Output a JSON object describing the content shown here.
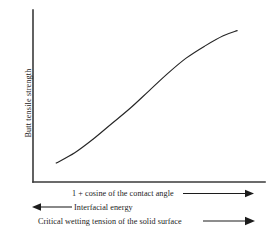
{
  "figure": {
    "background_color": "#ffffff",
    "axis_color": "#3a3a3a",
    "curve_color": "#262626",
    "annotation_color": "#1c1c1c"
  },
  "chart_data": {
    "type": "line",
    "title": "",
    "subtitle": "",
    "xlabel": "1 + cosine of the contact angle",
    "ylabel": "Butt tensile strength",
    "grid": false,
    "legend": false,
    "legend_position": "none",
    "axes_style": "open-left-bottom-spines-only",
    "tick_labels_x": [],
    "tick_labels_y": [],
    "xlim": [
      0,
      1
    ],
    "ylim": [
      0,
      1
    ],
    "series": [
      {
        "name": "butt tensile strength vs 1 + cosine of contact angle",
        "description": "monotonically increasing curve, concave up at the start, nearly linear in the middle, flattening (concave down) near the right end",
        "x": [
          0.1,
          0.18,
          0.26,
          0.34,
          0.42,
          0.5,
          0.58,
          0.66,
          0.74,
          0.82,
          0.88
        ],
        "y": [
          0.11,
          0.17,
          0.25,
          0.34,
          0.43,
          0.53,
          0.63,
          0.72,
          0.79,
          0.85,
          0.88
        ]
      }
    ],
    "annotations": [
      {
        "id": "contact-angle",
        "text": "1 + cosine of the contact angle",
        "direction": "right",
        "arrow": "right"
      },
      {
        "id": "interfacial-energy",
        "text": "Interfacial energy",
        "direction": "left",
        "arrow": "left"
      },
      {
        "id": "critical-wetting-tension",
        "text": "Critical wetting tension of the solid surface",
        "direction": "right",
        "arrow": "right"
      }
    ]
  }
}
